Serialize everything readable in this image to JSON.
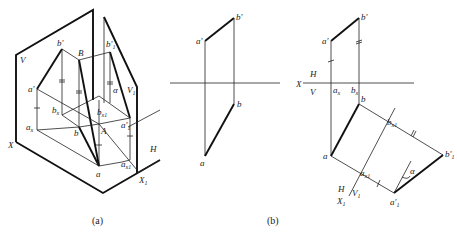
{
  "figure_a": {
    "caption": "(a)",
    "labels": {
      "V": "V",
      "X": "X",
      "H": "H",
      "X1": "X",
      "X1_sub": "1",
      "V1": "V",
      "V1_sub": "1",
      "b_prime": "b'",
      "B": "B",
      "b1_prime": "b'",
      "b1_prime_sub": "1",
      "a_prime": "a'",
      "ax": "a",
      "ax_sub": "x",
      "bx": "b",
      "bx_sub": "x",
      "b": "b",
      "A": "A",
      "bx1": "b",
      "bx1_sub": "x1",
      "alpha": "α",
      "a1_prime": "a'",
      "a1_prime_sub": "1",
      "a": "a",
      "ax1": "a",
      "ax1_sub": "x1"
    }
  },
  "figure_b_left": {
    "labels": {
      "a_prime": "a'",
      "b_prime": "b'",
      "b": "b",
      "a": "a"
    }
  },
  "figure_b": {
    "caption": "(b)",
    "labels": {
      "X": "X",
      "H": "H",
      "V": "V",
      "a_prime": "a'",
      "b_prime": "b'",
      "ax": "a",
      "ax_sub": "x",
      "bx": "b",
      "bx_sub": "x",
      "b": "b",
      "a": "a",
      "bx1": "b",
      "bx1_sub": "x1",
      "ax1": "a",
      "ax1_sub": "x1",
      "b1_prime": "b'",
      "b1_prime_sub": "1",
      "a1_prime": "a'",
      "a1_prime_sub": "1",
      "alpha": "α",
      "H2": "H",
      "V1": "V",
      "V1_sub": "1",
      "X1": "X",
      "X1_sub": "1"
    }
  }
}
